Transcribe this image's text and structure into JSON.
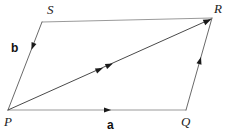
{
  "figure": {
    "type": "geometry-diagram",
    "width": 234,
    "height": 137,
    "background_color": "#ffffff",
    "edge_color_light": "#9a9a9a",
    "edge_color_dark": "#3a3a3a",
    "diagonal_color": "#4a4a4a",
    "label_color": "#222222",
    "vector_label_color": "#111111"
  },
  "vertices": [
    {
      "name": "P",
      "label": "P",
      "x": 8,
      "y": 110,
      "label_x": 4,
      "label_y": 116
    },
    {
      "name": "Q",
      "label": "Q",
      "x": 186,
      "y": 110,
      "label_x": 182,
      "label_y": 116
    },
    {
      "name": "R",
      "label": "R",
      "x": 212,
      "y": 18,
      "label_x": 214,
      "label_y": 3
    },
    {
      "name": "S",
      "label": "S",
      "x": 42,
      "y": 22,
      "label_x": 48,
      "label_y": 4
    }
  ],
  "edges": [
    {
      "name": "PQ",
      "from": "P",
      "to": "Q",
      "color": "#9a9a9a",
      "width": 1.1,
      "arrow_marks": 1,
      "vector": "a"
    },
    {
      "name": "SR",
      "from": "S",
      "to": "R",
      "color": "#9a9a9a",
      "width": 1.1,
      "arrow_marks": 0,
      "vector": ""
    },
    {
      "name": "PS",
      "from": "P",
      "to": "S",
      "color": "#6a6a6a",
      "width": 1.0,
      "arrow_marks": 1,
      "vector": "b"
    },
    {
      "name": "QR",
      "from": "Q",
      "to": "R",
      "color": "#6a6a6a",
      "width": 1.0,
      "arrow_marks": 1,
      "vector": "b"
    },
    {
      "name": "PR",
      "from": "P",
      "to": "R",
      "color": "#4a4a4a",
      "width": 1.0,
      "arrow_marks": 2,
      "vector": ""
    }
  ],
  "vector_labels": [
    {
      "name": "a",
      "label": "a",
      "x": 108,
      "y": 121,
      "describes": "PQ"
    },
    {
      "name": "b",
      "label": "b",
      "x": 10,
      "y": 44,
      "describes": "PS"
    }
  ],
  "arrow_markers": [
    {
      "on_edge": "PQ",
      "position": 0.56,
      "direction": "right",
      "count": 1
    },
    {
      "on_edge": "PS",
      "position": 0.76,
      "direction": "down-left",
      "count": 1
    },
    {
      "on_edge": "QR",
      "position": 0.48,
      "direction": "up-right",
      "count": 1
    },
    {
      "on_edge": "PR",
      "position": 0.5,
      "direction": "up-right",
      "count": 2
    },
    {
      "on_edge": "PR",
      "position": 1.0,
      "direction": "up-right",
      "count": 1
    }
  ]
}
